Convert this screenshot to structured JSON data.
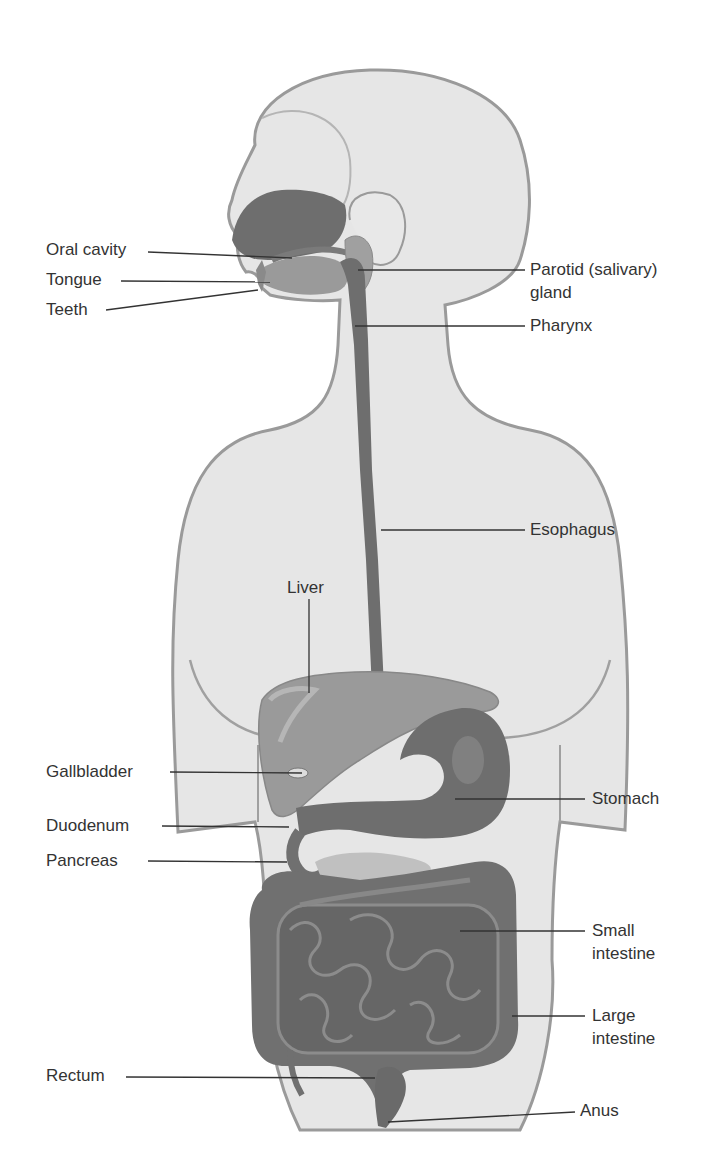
{
  "diagram": {
    "labels_left": [
      {
        "text": "Oral cavity"
      },
      {
        "text": "Tongue"
      },
      {
        "text": "Teeth"
      },
      {
        "text": "Liver"
      },
      {
        "text": "Gallbladder"
      },
      {
        "text": "Duodenum"
      },
      {
        "text": "Pancreas"
      },
      {
        "text": "Rectum"
      }
    ],
    "labels_right": [
      {
        "line1": "Parotid (salivary)",
        "line2": "gland"
      },
      {
        "text": "Pharynx"
      },
      {
        "text": "Esophagus"
      },
      {
        "text": "Stomach"
      },
      {
        "line1": "Small",
        "line2": "intestine"
      },
      {
        "line1": "Large",
        "line2": "intestine"
      },
      {
        "text": "Anus"
      }
    ],
    "colors": {
      "body_fill": "#e6e6e6",
      "body_outline": "#9a9a9a",
      "organ_dark": "#6e6e6e",
      "organ_mid": "#8a8a8a",
      "organ_light": "#a8a8a8",
      "leader_line": "#333333"
    }
  }
}
